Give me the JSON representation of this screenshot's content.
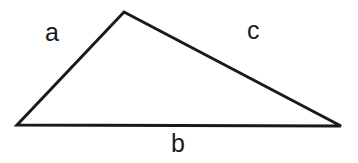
{
  "figure": {
    "kind": "geometry-diagram",
    "shape": "triangle",
    "background_color": "#ffffff",
    "stroke_color": "#1a1a1a",
    "stroke_width": 3,
    "width": 358,
    "height": 163
  },
  "vertices": {
    "apex": {
      "x": 124,
      "y": 12
    },
    "bottom_left": {
      "x": 17,
      "y": 125
    },
    "bottom_right": {
      "x": 341,
      "y": 126
    }
  },
  "labels": {
    "side_a": "a",
    "side_b": "b",
    "side_c": "c"
  },
  "chart_data": {
    "type": "diagram",
    "title": "",
    "shape": "triangle",
    "points": [
      {
        "name": "apex",
        "x": 124,
        "y": 12
      },
      {
        "name": "bottom_left",
        "x": 17,
        "y": 125
      },
      {
        "name": "bottom_right",
        "x": 341,
        "y": 126
      }
    ],
    "edges": [
      {
        "label": "a",
        "from": "bottom_left",
        "to": "apex"
      },
      {
        "label": "c",
        "from": "apex",
        "to": "bottom_right"
      },
      {
        "label": "b",
        "from": "bottom_left",
        "to": "bottom_right"
      }
    ],
    "annotations": [
      {
        "text": "a",
        "x": 53,
        "y": 33
      },
      {
        "text": "c",
        "x": 255,
        "y": 31
      },
      {
        "text": "b",
        "x": 179,
        "y": 148
      }
    ]
  }
}
